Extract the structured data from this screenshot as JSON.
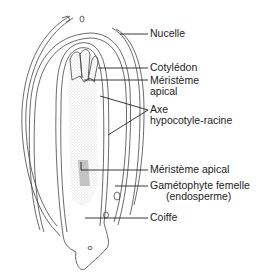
{
  "diagram": {
    "type": "botanical-cross-section",
    "line_color": "#333333",
    "stipple_color": "#bdbdbd"
  },
  "labels": [
    {
      "id": "nucelle",
      "lines": [
        "Nucelle"
      ]
    },
    {
      "id": "cotyledon",
      "lines": [
        "Cotylédon"
      ]
    },
    {
      "id": "meristeme-apical-top",
      "lines": [
        "Méristème",
        "apical"
      ]
    },
    {
      "id": "axe",
      "lines": [
        "Axe",
        "hypocotyle-racine"
      ]
    },
    {
      "id": "meristeme-apical-bottom",
      "lines": [
        "Méristème apical"
      ]
    },
    {
      "id": "gametophyte",
      "lines": [
        "Gamétophyte femelle",
        "(endosperme)"
      ]
    },
    {
      "id": "coiffe",
      "lines": [
        "Coiffe"
      ]
    }
  ]
}
